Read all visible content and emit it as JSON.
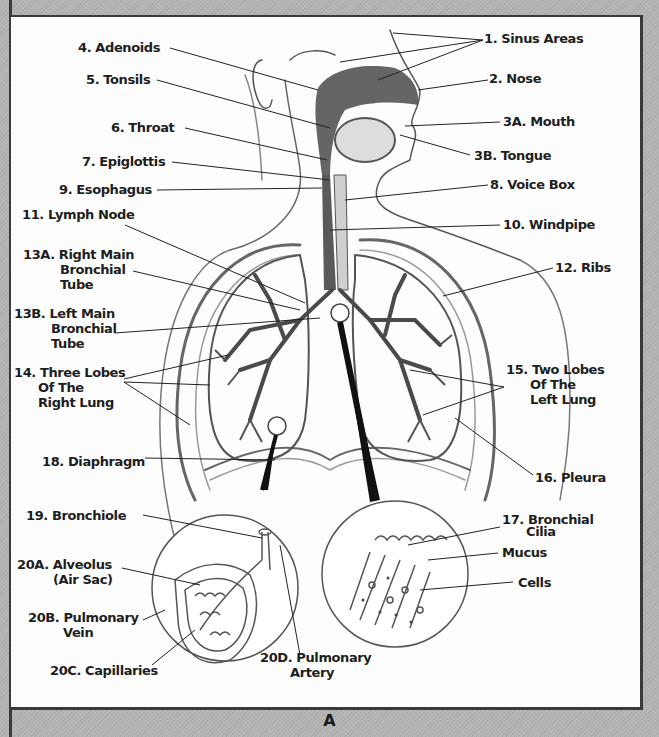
{
  "figure": {
    "caption": "A",
    "labels": {
      "sinus": "1. Sinus Areas",
      "nose": "2. Nose",
      "mouth": "3A. Mouth",
      "tongue": "3B. Tongue",
      "adenoids": "4. Adenoids",
      "tonsils": "5. Tonsils",
      "throat": "6. Throat",
      "epiglottis": "7. Epiglottis",
      "voicebox": "8. Voice Box",
      "esophagus": "9. Esophagus",
      "windpipe": "10. Windpipe",
      "lymph": "11. Lymph Node",
      "ribs": "12. Ribs",
      "rmbt": [
        "13A. Right Main",
        "Bronchial",
        "Tube"
      ],
      "lmbt": [
        "13B. Left Main",
        "Bronchial",
        "Tube"
      ],
      "rlung": [
        "14. Three Lobes",
        "Of The",
        "Right Lung"
      ],
      "llung": [
        "15. Two Lobes",
        "Of The",
        "Left Lung"
      ],
      "pleura": "16. Pleura",
      "cilia": [
        "17. Bronchial",
        "Cilia"
      ],
      "mucus": "Mucus",
      "cells": "Cells",
      "diaphragm": "18. Diaphragm",
      "bronchiole": "19. Bronchiole",
      "alveolus": [
        "20A. Alveolus",
        "(Air Sac)"
      ],
      "vein": [
        "20B. Pulmonary",
        "Vein"
      ],
      "capillaries": "20C. Capillaries",
      "artery": [
        "20D. Pulmonary",
        "Artery"
      ]
    },
    "colors": {
      "background": "#b4b4b4",
      "panel": "#fdfdfd",
      "ink": "#1e1e1e",
      "airway_dark": "#4a4a4a"
    }
  }
}
